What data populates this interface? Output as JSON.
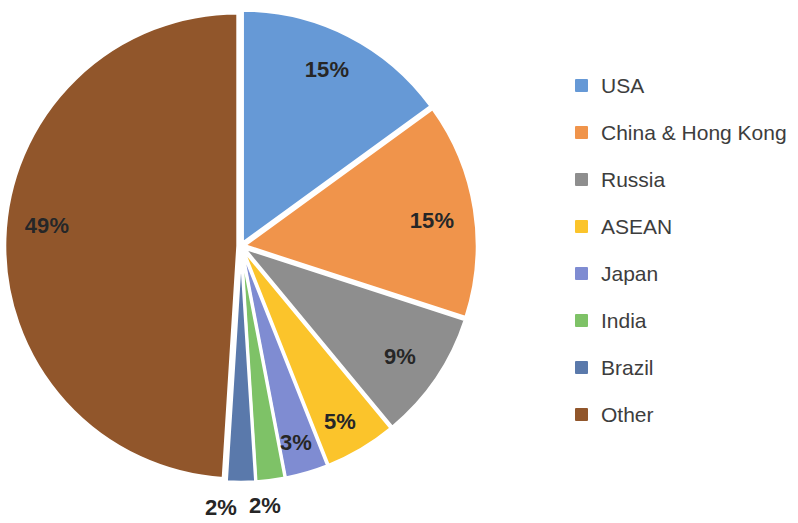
{
  "chart_data": {
    "type": "pie",
    "title": "",
    "subtitle": "",
    "xlabel": "",
    "ylabel": "",
    "legend_position": "right",
    "grid": false,
    "exploded": true,
    "start_angle_deg": 0,
    "direction": "clockwise",
    "categories": [
      "USA",
      "China & Hong Kong",
      "Russia",
      "ASEAN",
      "Japan",
      "India",
      "Brazil",
      "Other"
    ],
    "values": [
      15,
      15,
      9,
      5,
      3,
      2,
      2,
      49
    ],
    "value_unit": "%",
    "data_labels": [
      "15%",
      "15%",
      "9%",
      "5%",
      "3%",
      "2%",
      "2%",
      "49%"
    ],
    "colors": [
      "#6699D6",
      "#F0944B",
      "#8E8E8E",
      "#FBC42B",
      "#7F8CD2",
      "#7EC267",
      "#5A79AB",
      "#91562B"
    ],
    "slices": [
      {
        "label": "USA",
        "value": 15,
        "data_label": "15%",
        "color": "#6699D6",
        "label_x": 327,
        "label_y": 70
      },
      {
        "label": "China & Hong Kong",
        "value": 15,
        "data_label": "15%",
        "color": "#F0944B",
        "label_x": 432,
        "label_y": 221
      },
      {
        "label": "Russia",
        "value": 9,
        "data_label": "9%",
        "color": "#8E8E8E",
        "label_x": 400,
        "label_y": 357
      },
      {
        "label": "ASEAN",
        "value": 5,
        "data_label": "5%",
        "color": "#FBC42B",
        "label_x": 340,
        "label_y": 422
      },
      {
        "label": "Japan",
        "value": 3,
        "data_label": "3%",
        "color": "#7F8CD2",
        "label_x": 296,
        "label_y": 443
      },
      {
        "label": "India",
        "value": 2,
        "data_label": "2%",
        "color": "#7EC267",
        "label_x": 265,
        "label_y": 506
      },
      {
        "label": "Brazil",
        "value": 2,
        "data_label": "2%",
        "color": "#5A79AB",
        "label_x": 221,
        "label_y": 508
      },
      {
        "label": "Other",
        "value": 49,
        "data_label": "49%",
        "color": "#91562B",
        "label_x": 47,
        "label_y": 226
      }
    ]
  },
  "legend": {
    "items": [
      {
        "label": "USA",
        "color": "#6699D6"
      },
      {
        "label": "China & Hong Kong",
        "color": "#F0944B"
      },
      {
        "label": "Russia",
        "color": "#8E8E8E"
      },
      {
        "label": "ASEAN",
        "color": "#FBC42B"
      },
      {
        "label": "Japan",
        "color": "#7F8CD2"
      },
      {
        "label": "India",
        "color": "#7EC267"
      },
      {
        "label": "Brazil",
        "color": "#5A79AB"
      },
      {
        "label": "Other",
        "color": "#91562B"
      }
    ]
  },
  "geometry": {
    "center_x": 241,
    "center_y": 246,
    "radius": 233,
    "explode_offset": 3.2
  }
}
